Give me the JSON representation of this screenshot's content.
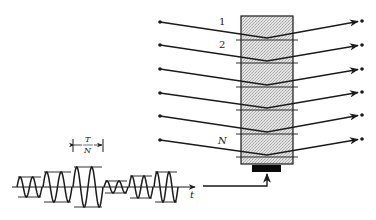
{
  "diagram": {
    "labels": {
      "line_1": "1",
      "line_2": "2",
      "line_N": "N",
      "time_axis": "t",
      "bracket_numerator": "T",
      "bracket_denominator": "N"
    },
    "colors": {
      "ink": "#1a1a1a",
      "medium_fill": "#d9d9d9",
      "transducer": "#0a0a0a",
      "background": "#ffffff"
    },
    "rays": [
      {
        "label": "1",
        "y_left": 22,
        "y_vertex": 38,
        "y_right": 21
      },
      {
        "label": "2",
        "y_left": 45,
        "y_vertex": 61,
        "y_right": 45
      },
      {
        "label": "",
        "y_left": 69,
        "y_vertex": 85,
        "y_right": 69
      },
      {
        "label": "",
        "y_left": 93,
        "y_vertex": 108,
        "y_right": 92
      },
      {
        "label": "",
        "y_left": 116,
        "y_vertex": 132,
        "y_right": 115
      },
      {
        "label": "N",
        "y_left": 140,
        "y_vertex": 155,
        "y_right": 139
      }
    ],
    "waveform_segments": [
      {
        "x_start": 17,
        "x_end": 42,
        "amplitude": 10,
        "cycles": 2
      },
      {
        "x_start": 43,
        "x_end": 72,
        "amplitude": 15,
        "cycles": 2
      },
      {
        "x_start": 73,
        "x_end": 103,
        "amplitude": 20,
        "cycles": 2
      },
      {
        "x_start": 104,
        "x_end": 128,
        "amplitude": 6,
        "cycles": 2
      },
      {
        "x_start": 129,
        "x_end": 153,
        "amplitude": 11,
        "cycles": 2
      },
      {
        "x_start": 154,
        "x_end": 178,
        "amplitude": 15,
        "cycles": 2
      }
    ]
  }
}
